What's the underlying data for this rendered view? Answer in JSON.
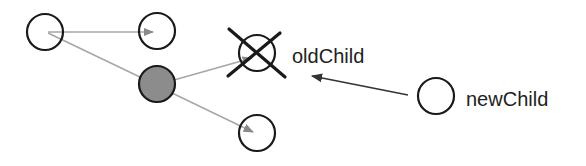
{
  "diagram": {
    "type": "tree-node-replacement",
    "colors": {
      "background": "#ffffff",
      "node_stroke": "#1a1a1a",
      "node_fill": "#ffffff",
      "parent_fill": "#8c8c8c",
      "edge": "#a6a6a6",
      "replace_arrow": "#333333",
      "cross": "#1a1a1a",
      "label": "#222222"
    },
    "nodes": [
      {
        "id": "root",
        "label": "",
        "cx": 45,
        "cy": 32,
        "r": 18,
        "filled": false
      },
      {
        "id": "sibling-top",
        "label": "",
        "cx": 157,
        "cy": 31,
        "r": 18,
        "filled": false
      },
      {
        "id": "parent",
        "label": "",
        "cx": 157,
        "cy": 84,
        "r": 18,
        "filled": true
      },
      {
        "id": "old-child",
        "label": "oldChild",
        "cx": 257,
        "cy": 53,
        "r": 18,
        "filled": false,
        "crossed_out": true
      },
      {
        "id": "child-bottom",
        "label": "",
        "cx": 257,
        "cy": 133,
        "r": 18,
        "filled": false
      },
      {
        "id": "new-child",
        "label": "newChild",
        "cx": 436,
        "cy": 96,
        "r": 18,
        "filled": false
      }
    ],
    "edges": [
      {
        "from": "root",
        "to": "sibling-top"
      },
      {
        "from": "root",
        "to": "parent"
      },
      {
        "from": "parent",
        "to": "old-child"
      },
      {
        "from": "parent",
        "to": "child-bottom"
      }
    ],
    "replace_arrow": {
      "from": "new-child",
      "to": "old-child"
    },
    "labels": {
      "old_child": "oldChild",
      "new_child": "newChild"
    }
  }
}
